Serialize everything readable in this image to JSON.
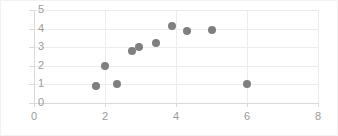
{
  "chart_data": {
    "type": "scatter",
    "title": "",
    "xlabel": "",
    "ylabel": "",
    "xlim": [
      0,
      8
    ],
    "ylim": [
      0,
      5
    ],
    "xticks": [
      0,
      2,
      4,
      6,
      8
    ],
    "yticks": [
      0,
      1,
      2,
      3,
      4,
      5
    ],
    "xtick_labels": [
      "0",
      "2",
      "4",
      "6",
      "8"
    ],
    "ytick_labels": [
      "0",
      "1",
      "2",
      "3",
      "4",
      "5"
    ],
    "grid": "horizontal-and-vertical",
    "legend": "none",
    "marker_color": "#7f7f7f",
    "gridline_color": "#ececec",
    "axis_color": "#d9d9d9",
    "tick_label_color": "#9a9a9a",
    "background_color": "#ffffff",
    "series": [
      {
        "name": "Series 1",
        "points": [
          {
            "x": 1.75,
            "y": 0.9
          },
          {
            "x": 2.0,
            "y": 2.0
          },
          {
            "x": 2.35,
            "y": 1.0
          },
          {
            "x": 2.75,
            "y": 2.8
          },
          {
            "x": 2.95,
            "y": 3.0
          },
          {
            "x": 3.45,
            "y": 3.2
          },
          {
            "x": 3.9,
            "y": 4.15
          },
          {
            "x": 4.3,
            "y": 3.85
          },
          {
            "x": 5.0,
            "y": 3.95
          },
          {
            "x": 6.0,
            "y": 1.0
          }
        ]
      }
    ]
  }
}
